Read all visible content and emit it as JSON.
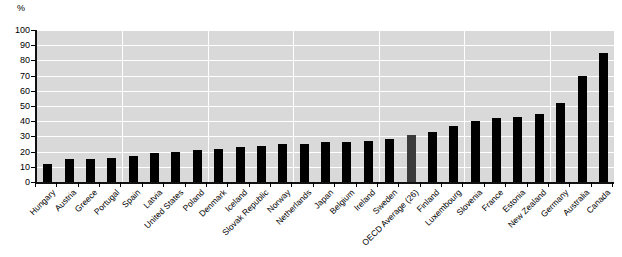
{
  "chart_data": {
    "type": "bar",
    "title": "",
    "xlabel": "",
    "ylabel": "%",
    "unit_label": "%",
    "ylim": [
      0,
      100
    ],
    "ytick_labels": [
      "100",
      "90",
      "80",
      "70",
      "60",
      "50",
      "40",
      "30",
      "20",
      "10",
      "0"
    ],
    "ytick_values": [
      100,
      90,
      80,
      70,
      60,
      50,
      40,
      30,
      20,
      10,
      0
    ],
    "grid": true,
    "legend": "none",
    "bar_color": "#000000",
    "highlight_color": "#3a3a3a",
    "plot_background": "#d9d9d9",
    "gridline_color": "#ffffff",
    "highlight_category": "OECD Average (26)",
    "categories": [
      "Hungary",
      "Austria",
      "Greece",
      "Portugal",
      "Spain",
      "Latvia",
      "United States",
      "Poland",
      "Denmark",
      "Iceland",
      "Slovak Republic",
      "Norway",
      "Netherlands",
      "Japan",
      "Belgium",
      "Ireland",
      "Sweden",
      "OECD Average (26)",
      "Finland",
      "Luxembourg",
      "Slovenia",
      "France",
      "Estonia",
      "New Zealand",
      "Germany",
      "Australia",
      "Canada"
    ],
    "values": [
      12,
      15,
      15,
      16,
      17,
      19,
      20,
      21,
      22,
      23,
      24,
      25,
      25,
      26,
      26,
      27,
      28,
      31,
      33,
      37,
      40,
      42,
      43,
      45,
      52,
      70,
      85
    ]
  }
}
